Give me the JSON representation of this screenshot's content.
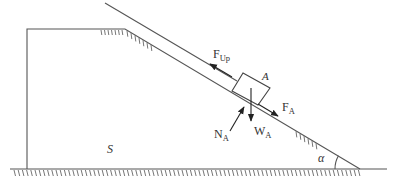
{
  "figure": {
    "type": "physics free-body diagram",
    "labels": {
      "block": "A",
      "support": "S",
      "angle": "α",
      "force_up": {
        "main": "F",
        "sub": "Up"
      },
      "force_a": {
        "main": "F",
        "sub": "A"
      },
      "normal": {
        "main": "N",
        "sub": "A"
      },
      "weight": {
        "main": "W",
        "sub": "A"
      }
    },
    "colors": {
      "line": "#555555",
      "text": "#333333",
      "background": "#ffffff"
    }
  }
}
